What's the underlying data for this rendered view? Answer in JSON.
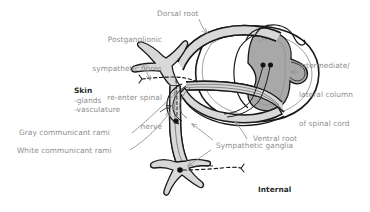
{
  "figure": {
    "background_color": "#ffffff",
    "width": 370,
    "height": 212
  },
  "colors": {
    "label_gray": "#8e8e8e",
    "label_dark": "#2b2b2b",
    "outline": "#1a1a1a",
    "nerve_fill": "#d8d8d8",
    "gray_matter_fill": "#a8a8a8",
    "cord_fill": "#cfcfcf",
    "neuron_dot": "#111111"
  },
  "labels": {
    "postganglionic": {
      "lines": [
        "Postganglionic",
        "sympathetic fibres",
        "re-enter spinal",
        "nerve"
      ],
      "text": "Postganglionic\nsympathetic fibres\nre-enter spinal\nnerve",
      "style": "regular",
      "align": "right"
    },
    "dorsal_root": {
      "text": "Dorsal root",
      "style": "regular"
    },
    "intermediate_lateral_column": {
      "lines": [
        "Intermediate/",
        "lateral column",
        "of spinal cord"
      ],
      "text": "Intermediate/\nlateral column\nof spinal cord",
      "style": "regular",
      "align": "left"
    },
    "skin": {
      "heading": "Skin",
      "items": [
        "-glands",
        "-vasculature"
      ],
      "style": "bold-heading"
    },
    "gray_communicant_rami": {
      "text": "Gray communicant rami",
      "style": "regular"
    },
    "white_communicant_rami": {
      "text": "White communicant rami",
      "style": "regular"
    },
    "ventral_root": {
      "text": "Ventral root",
      "style": "regular"
    },
    "sympathetic_ganglia": {
      "text": "Sympathetic ganglia",
      "style": "regular"
    },
    "internal_organs": {
      "lines": [
        "Internal",
        "organs/vessels"
      ],
      "text": "Internal\norgans/vessels",
      "style": "bold",
      "align": "left"
    }
  }
}
